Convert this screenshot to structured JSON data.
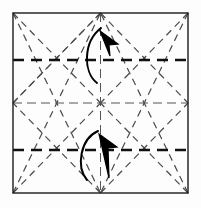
{
  "figure": {
    "width": 201,
    "height": 208,
    "background_color": "#fdfdfd"
  },
  "colors": {
    "outline": "#1a1a1a",
    "bold_crease": "#111111",
    "light_crease": "#555555",
    "diagonal_crease": "#4a4a4a",
    "arrow": "#000000",
    "background": "#fdfdfd"
  },
  "paper": {
    "label": "square-sheet",
    "left": 13,
    "top": 13,
    "right": 188,
    "bottom": 193,
    "stroke_width": 1.4
  },
  "geometry": {
    "center": {
      "x": 100.5,
      "y": 103
    },
    "quarter_y_top": 60,
    "quarter_y_bottom": 150,
    "mid_y": 103,
    "mid_x": 100.5,
    "quarter_x_left": 56,
    "quarter_x_right": 145
  },
  "creases": {
    "bold_horizontal": [
      {
        "name": "upper-quarter-crease",
        "x1": 13,
        "y1": 60,
        "x2": 188,
        "y2": 60,
        "width": 2.6,
        "dash": "11 7"
      },
      {
        "name": "lower-quarter-crease",
        "x1": 13,
        "y1": 150,
        "x2": 188,
        "y2": 150,
        "width": 2.6,
        "dash": "11 7"
      }
    ],
    "light_axes": [
      {
        "name": "horizontal-midline-crease",
        "x1": 13,
        "y1": 103,
        "x2": 188,
        "y2": 103,
        "width": 1.0,
        "dash": "9 5"
      },
      {
        "name": "vertical-midline-crease",
        "x1": 100.5,
        "y1": 13,
        "x2": 100.5,
        "y2": 193,
        "width": 1.0,
        "dash": "9 5"
      }
    ],
    "diagonals": [
      {
        "name": "diagonal-tl-corner-to-center",
        "x1": 13,
        "y1": 13,
        "x2": 100.5,
        "y2": 103
      },
      {
        "name": "diagonal-tr-corner-to-center",
        "x1": 188,
        "y1": 13,
        "x2": 100.5,
        "y2": 103
      },
      {
        "name": "diagonal-bl-corner-to-center",
        "x1": 13,
        "y1": 193,
        "x2": 100.5,
        "y2": 103
      },
      {
        "name": "diagonal-br-corner-to-center",
        "x1": 188,
        "y1": 193,
        "x2": 100.5,
        "y2": 103
      },
      {
        "name": "diagonal-top-mid-to-left-mid",
        "x1": 100.5,
        "y1": 13,
        "x2": 13,
        "y2": 103
      },
      {
        "name": "diagonal-top-mid-to-right-mid",
        "x1": 100.5,
        "y1": 13,
        "x2": 188,
        "y2": 103
      },
      {
        "name": "diagonal-bottom-mid-to-left-mid",
        "x1": 100.5,
        "y1": 193,
        "x2": 13,
        "y2": 103
      },
      {
        "name": "diagonal-bottom-mid-to-right-mid",
        "x1": 100.5,
        "y1": 193,
        "x2": 188,
        "y2": 103
      },
      {
        "name": "diagonal-left-edge-upper-fan",
        "x1": 13,
        "y1": 103,
        "x2": 100.5,
        "y2": 13
      },
      {
        "name": "diagonal-tl-to-bottom-mid",
        "x1": 13,
        "y1": 13,
        "x2": 100.5,
        "y2": 193
      },
      {
        "name": "diagonal-tr-to-bottom-mid",
        "x1": 188,
        "y1": 13,
        "x2": 100.5,
        "y2": 193
      },
      {
        "name": "diagonal-bl-to-top-mid",
        "x1": 13,
        "y1": 193,
        "x2": 100.5,
        "y2": 13
      },
      {
        "name": "diagonal-br-to-top-mid",
        "x1": 188,
        "y1": 193,
        "x2": 100.5,
        "y2": 13
      }
    ],
    "dash_pattern_diagonal": "7 5",
    "diagonal_width": 1.2
  },
  "arrows": [
    {
      "name": "fold-arrow-upward",
      "direction": "up",
      "description": "Valley fold bringing lower quarter edge upward",
      "shaft_path": "M 97 83 C 83 72 83 42 101 28",
      "head_path": "M 100 31 L 118 44 L 109 45 L 110 56 Z",
      "head_tip": {
        "x": 101,
        "y": 28
      }
    },
    {
      "name": "fold-arrow-downward",
      "direction": "down",
      "description": "Valley fold bringing upper quarter edge downward",
      "shaft_path": "M 87 180 C 76 167 80 139 98 131",
      "head_path": "M 99 134 L 117 147 L 108 148 L 109 178 Z",
      "head_tip": {
        "x": 108,
        "y": 180
      }
    }
  ],
  "legend": {
    "bold_dash_meaning": "primary fold line",
    "light_dash_meaning": "existing crease",
    "arrow_meaning": "fold direction"
  }
}
